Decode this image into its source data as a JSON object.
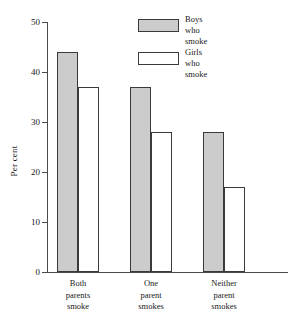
{
  "chart_data": {
    "type": "bar",
    "title": "",
    "xlabel": "",
    "ylabel": "Per cent",
    "ylim": [
      0,
      50
    ],
    "yticks": [
      0,
      10,
      20,
      30,
      40,
      50
    ],
    "grid": false,
    "legend_position": "top-center",
    "categories": [
      "Both parents smoke",
      "One parent smokes",
      "Neither parent smokes"
    ],
    "category_lines": [
      [
        "Both",
        "parents",
        "smoke"
      ],
      [
        "One",
        "parent",
        "smokes"
      ],
      [
        "Neither",
        "parent",
        "smokes"
      ]
    ],
    "series": [
      {
        "name": "Boys who smoke",
        "name_lines": [
          "Boys",
          "who",
          "smoke"
        ],
        "color": "#cccccc",
        "values": [
          44,
          37,
          28
        ]
      },
      {
        "name": "Girls who smoke",
        "name_lines": [
          "Girls",
          "who",
          "smoke"
        ],
        "color": "#ffffff",
        "values": [
          37,
          28,
          17
        ]
      }
    ]
  },
  "axis": {
    "y_title": "Per cent",
    "tick_labels": [
      "50",
      "40",
      "30",
      "20",
      "10",
      "0"
    ]
  },
  "legend": {
    "items": [
      {
        "line1": "Boys",
        "line2": "who",
        "line3": "smoke"
      },
      {
        "line1": "Girls",
        "line2": "who",
        "line3": "smoke"
      }
    ]
  },
  "categories": [
    {
      "line1": "Both",
      "line2": "parents",
      "line3": "smoke"
    },
    {
      "line1": "One",
      "line2": "parent",
      "line3": "smokes"
    },
    {
      "line1": "Neither",
      "line2": "parent",
      "line3": "smokes"
    }
  ],
  "colors": {
    "boys_fill": "#cccccc",
    "girls_fill": "#ffffff",
    "stroke": "#3a3a3a",
    "axis": "#4a4a4a"
  }
}
